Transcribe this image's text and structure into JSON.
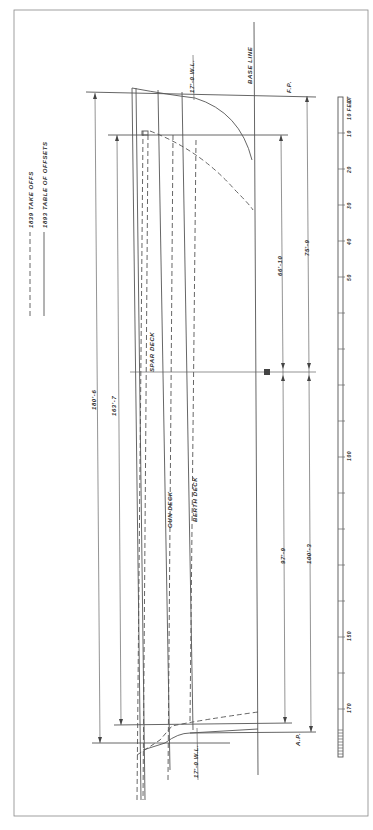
{
  "legend": {
    "dashed_label": "1839 TAKE OFFS",
    "solid_label": "1893 TABLE OF OFFSETS"
  },
  "labels": {
    "base_line": "BASE LINE",
    "fp": "F.P.",
    "ap": "A.P.",
    "wl_fwd": "17'-0 W.L.",
    "wl_aft": "17'-0 W.L.",
    "spar_deck": "SPAR DECK",
    "gun_deck": "GUN DECK",
    "berth_deck": "BERTH DECK",
    "midship_symbol": "⊠"
  },
  "dimensions": {
    "overall_length": "180'-6",
    "deck_length": "163'-7",
    "fwd_to_mid_inner": "66'-10",
    "fwd_to_mid_outer": "75'-9",
    "mid_to_aft_inner": "97'-9",
    "mid_to_aft_outer": "100'-3"
  },
  "scale_bar": {
    "unit_label": "10 FEET",
    "ticks": [
      "0",
      "10",
      "20",
      "30",
      "40",
      "50",
      "100",
      "150",
      "170"
    ]
  }
}
